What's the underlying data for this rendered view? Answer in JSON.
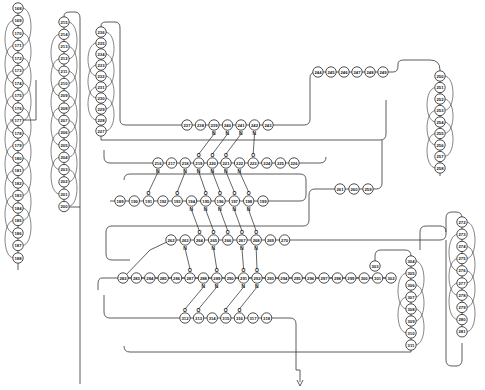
{
  "diagram": {
    "type": "protein-secondary-structure-topology",
    "helices": [
      {
        "id": "helix-168-188",
        "x": 18,
        "y0": 8,
        "step": 12.5,
        "residues": [
          168,
          169,
          170,
          171,
          172,
          173,
          174,
          175,
          176,
          177,
          178,
          179,
          180,
          181,
          182,
          183,
          184,
          185,
          186,
          187,
          188
        ]
      },
      {
        "id": "helix-215-200",
        "x": 64,
        "y0": 22,
        "step": 12.3,
        "residues": [
          215,
          214,
          213,
          212,
          211,
          210,
          209,
          208,
          207,
          206,
          205,
          204,
          203,
          202,
          201,
          200
        ]
      },
      {
        "id": "helix-236-227",
        "x": 101,
        "y0": 32,
        "step": 11,
        "residues": [
          236,
          235,
          234,
          233,
          232,
          231,
          230,
          229,
          228,
          227
        ]
      },
      {
        "id": "helix-250-258",
        "x": 440,
        "y0": 76,
        "step": 11.5,
        "residues": [
          250,
          251,
          252,
          253,
          254,
          255,
          256,
          257,
          258
        ]
      },
      {
        "id": "helix-272-281",
        "x": 462,
        "y0": 222,
        "step": 12.2,
        "residues": [
          272,
          273,
          274,
          275,
          276,
          277,
          278,
          279,
          280,
          281
        ]
      },
      {
        "id": "helix-304-311",
        "x": 411,
        "y0": 261,
        "step": 12,
        "residues": [
          304,
          305,
          306,
          307,
          308,
          309,
          310,
          311
        ]
      }
    ],
    "strands": [
      {
        "id": "strand-237-243",
        "y": 125,
        "x0": 187,
        "step": 13.5,
        "residues": [
          237,
          238,
          239,
          240,
          241,
          242,
          243
        ]
      },
      {
        "id": "strand-244-249",
        "y": 72,
        "x0": 318,
        "step": 13,
        "residues": [
          244,
          245,
          246,
          247,
          248,
          249
        ]
      },
      {
        "id": "strand-216-226",
        "y": 163,
        "x0": 158,
        "step": 13.6,
        "residues": [
          216,
          217,
          218,
          219,
          220,
          221,
          222,
          223,
          224,
          225,
          226
        ]
      },
      {
        "id": "strand-189-199",
        "y": 201,
        "x0": 120,
        "step": 14.3,
        "residues": [
          189,
          190,
          191,
          192,
          193,
          194,
          195,
          196,
          197,
          198,
          199
        ]
      },
      {
        "id": "strand-261-259",
        "y": 189,
        "x0": 340,
        "step": 14,
        "residues": [
          261,
          260,
          259
        ]
      },
      {
        "id": "strand-262-270",
        "y": 240,
        "x0": 171,
        "step": 14.2,
        "residues": [
          262,
          263,
          264,
          265,
          266,
          267,
          268,
          269,
          270
        ]
      },
      {
        "id": "strand-282-302",
        "y": 278,
        "x0": 123,
        "step": 13.4,
        "residues": [
          282,
          283,
          284,
          285,
          286,
          287,
          288,
          289,
          290,
          291,
          292,
          293,
          294,
          295,
          296,
          297,
          298,
          299,
          300,
          301,
          302
        ]
      },
      {
        "id": "strand-312-318",
        "y": 318,
        "x0": 185,
        "step": 13.6,
        "residues": [
          312,
          313,
          314,
          315,
          316,
          317,
          318
        ]
      }
    ],
    "extra_residues": [
      {
        "n": 303,
        "x": 375,
        "y": 266
      }
    ],
    "hbond_labels": {
      "donor": "N",
      "acceptor": "O"
    },
    "hbonds": [
      [
        239,
        219
      ],
      [
        240,
        220
      ],
      [
        241,
        221
      ],
      [
        242,
        223
      ],
      [
        216,
        191
      ],
      [
        218,
        193
      ],
      [
        219,
        195
      ],
      [
        220,
        196
      ],
      [
        221,
        197
      ],
      [
        222,
        198
      ],
      [
        194,
        264
      ],
      [
        195,
        265
      ],
      [
        196,
        266
      ],
      [
        197,
        267
      ],
      [
        198,
        268
      ],
      [
        263,
        287
      ],
      [
        265,
        289
      ],
      [
        267,
        291
      ],
      [
        268,
        292
      ],
      [
        289,
        313
      ],
      [
        291,
        315
      ],
      [
        292,
        316
      ],
      [
        288,
        312
      ]
    ],
    "chain_color": "#333333",
    "terminus_arrow": "C-terminus arrow"
  }
}
